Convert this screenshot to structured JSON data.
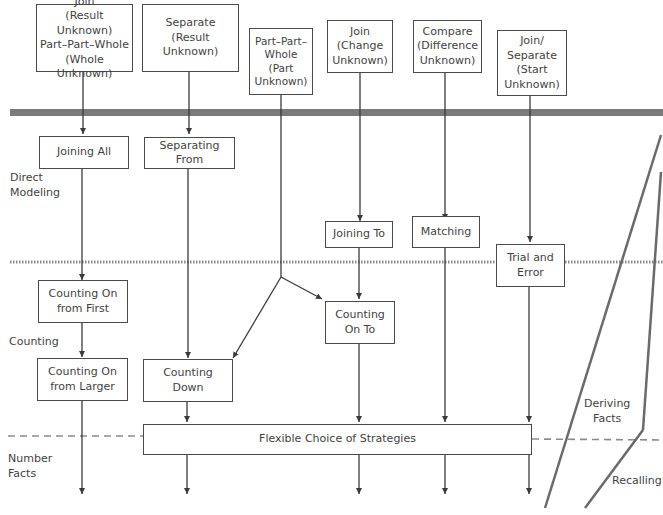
{
  "problem_types": [
    {
      "id": "join-result-unknown",
      "label": "Join\n(Result Unknown)\nPart–Part–Whole\n(Whole Unknown)"
    },
    {
      "id": "separate-result-unknown",
      "label": "Separate\n(Result Unknown)"
    },
    {
      "id": "ppw-part-unknown",
      "label": "Part–Part–\nWhole\n(Part\nUnknown)"
    },
    {
      "id": "join-change-unknown",
      "label": "Join\n(Change\nUnknown)"
    },
    {
      "id": "compare-difference-unknown",
      "label": "Compare\n(Difference\nUnknown)"
    },
    {
      "id": "join-separate-start-unknown",
      "label": "Join/\nSeparate\n(Start\nUnknown)"
    }
  ],
  "strategies": {
    "joining_all": "Joining All",
    "separating_from": "Separating From",
    "joining_to": "Joining To",
    "matching": "Matching",
    "trial_and_error": "Trial and\nError",
    "counting_on_from_first": "Counting On\nfrom First",
    "counting_on_to": "Counting\nOn To",
    "counting_on_from_larger": "Counting On\nfrom Larger",
    "counting_down": "Counting\nDown",
    "flexible_choice": "Flexible Choice of Strategies"
  },
  "levels": {
    "direct_modeling": "Direct\nModeling",
    "counting": "Counting",
    "number_facts": "Number\nFacts",
    "deriving_facts": "Deriving\nFacts",
    "recalling": "Recalling"
  },
  "colors": {
    "line": "#3a3a3a",
    "band": "#7a7a7a",
    "dotted": "#8a8a8a",
    "dashed": "#8a8a8a",
    "box_border": "#4a4a4a"
  }
}
